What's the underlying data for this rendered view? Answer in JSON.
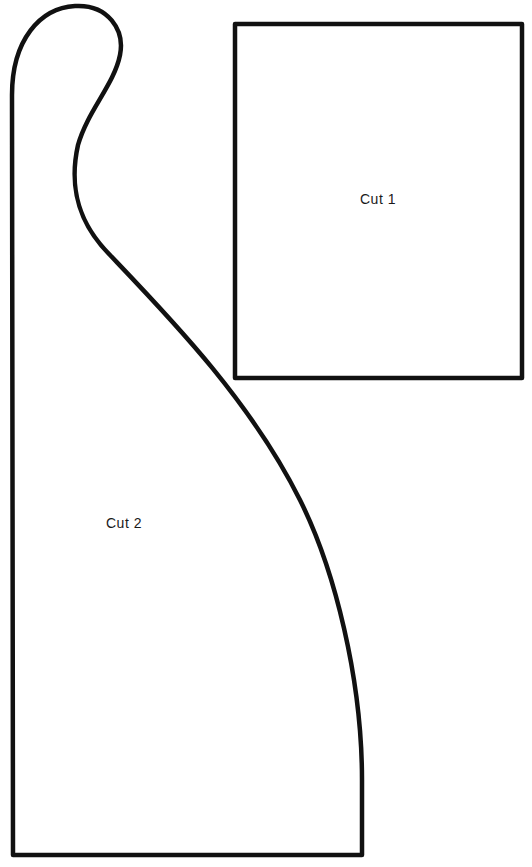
{
  "pattern": {
    "pieces": [
      {
        "id": "piece-1",
        "label": "Cut 1",
        "shape": "rectangle"
      },
      {
        "id": "piece-2",
        "label": "Cut 2",
        "shape": "curved-hook"
      }
    ],
    "colors": {
      "outline": "#111111",
      "background": "#ffffff",
      "text": "#1a1a1a"
    }
  }
}
